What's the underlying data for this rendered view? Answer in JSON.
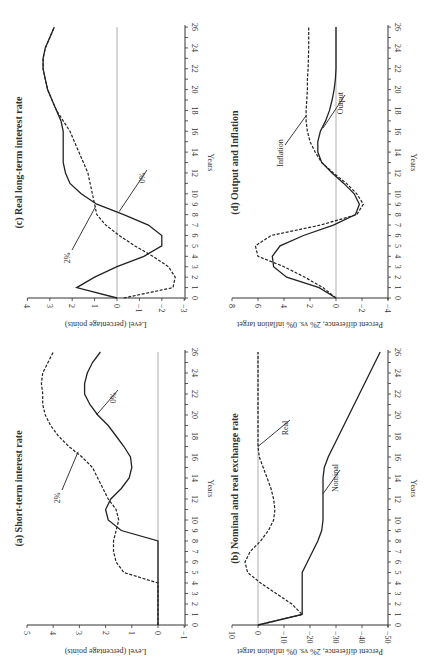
{
  "figure": {
    "orientation": "rotated 90 degrees counterclockwise",
    "panels": {
      "a": {
        "title": "(a) Short-term interest rate",
        "ylabel": "Level (percentage points)",
        "xlabel": "Years"
      },
      "b": {
        "title": "(b) Nominal and real exchange rate",
        "ylabel": "Percent difference, 2% vs. 0% inflation target",
        "xlabel": "Years"
      },
      "c": {
        "title": "(c) Real long-term interest rate",
        "ylabel": "Level (percentage points)",
        "xlabel": "Years"
      },
      "d": {
        "title": "(d) Output and Inflation",
        "ylabel": "Percent difference, 2% vs. 0% inflation target",
        "xlabel": "Years"
      }
    }
  },
  "chart_data": [
    {
      "id": "a",
      "type": "line",
      "title": "(a) Short-term interest rate",
      "xlabel": "Years",
      "ylabel": "Level (percentage points)",
      "xlim": [
        0,
        26
      ],
      "ylim": [
        -1,
        5
      ],
      "xticks": [
        0,
        1,
        2,
        3,
        4,
        5,
        6,
        7,
        8,
        9,
        10,
        12,
        14,
        16,
        18,
        20,
        22,
        24,
        26
      ],
      "yticks": [
        -1,
        0,
        1,
        2,
        3,
        4,
        5
      ],
      "zero_line": true,
      "x": [
        0,
        2,
        4,
        5,
        6,
        7,
        8,
        9,
        10,
        11,
        12,
        13,
        14,
        15,
        16,
        17,
        18,
        19,
        20,
        21,
        22,
        23,
        24,
        25,
        26
      ],
      "series": [
        {
          "name": "0%",
          "style": "solid",
          "values": [
            0,
            0,
            0,
            0,
            0,
            0,
            0,
            1.4,
            1.9,
            2.0,
            1.8,
            1.4,
            1.1,
            1.0,
            1.05,
            1.3,
            1.6,
            1.9,
            2.3,
            2.6,
            2.8,
            2.8,
            2.7,
            2.5,
            2.2
          ]
        },
        {
          "name": "2%",
          "style": "dashed",
          "values": [
            0,
            0,
            0,
            1.3,
            1.6,
            1.7,
            1.7,
            1.6,
            1.5,
            1.6,
            1.9,
            2.1,
            2.3,
            2.5,
            2.9,
            3.4,
            3.8,
            4.1,
            4.3,
            4.4,
            4.4,
            4.45,
            4.4,
            4.2,
            4.0
          ]
        }
      ]
    },
    {
      "id": "b",
      "type": "line",
      "title": "(b) Nominal and real exchange rate",
      "xlabel": "Years",
      "ylabel": "Percent difference, 2% vs. 0% inflation target",
      "xlim": [
        0,
        26
      ],
      "ylim": [
        -50,
        10
      ],
      "xticks": [
        0,
        1,
        2,
        3,
        4,
        5,
        6,
        7,
        8,
        9,
        10,
        12,
        14,
        16,
        18,
        20,
        22,
        24,
        26
      ],
      "yticks": [
        10,
        0,
        -10,
        -20,
        -30,
        -40,
        -50
      ],
      "zero_line": true,
      "x": [
        0,
        1,
        2,
        3,
        4,
        5,
        6,
        7,
        8,
        9,
        10,
        11,
        12,
        13,
        14,
        15,
        16,
        17,
        18,
        20,
        22,
        24,
        26
      ],
      "series": [
        {
          "name": "Nominal",
          "style": "solid",
          "values": [
            0,
            -17,
            -17,
            -17,
            -17,
            -17,
            -19,
            -21,
            -23,
            -24.5,
            -25,
            -25,
            -25,
            -25,
            -25,
            -25.5,
            -27,
            -29,
            -31,
            -35,
            -39,
            -43,
            -47
          ]
        },
        {
          "name": "Real",
          "style": "dashed",
          "values": [
            0,
            -17,
            -13,
            -7,
            -1,
            4,
            5,
            3,
            -1,
            -4,
            -6,
            -6.5,
            -6,
            -5,
            -3.5,
            -2,
            -0.5,
            0,
            0,
            0,
            0,
            0,
            0
          ]
        }
      ]
    },
    {
      "id": "c",
      "type": "line",
      "title": "(c) Real long-term interest rate",
      "xlabel": "Years",
      "ylabel": "Level (percentage points)",
      "xlim": [
        0,
        26
      ],
      "ylim": [
        -3,
        4
      ],
      "xticks": [
        0,
        1,
        2,
        3,
        4,
        5,
        6,
        7,
        8,
        9,
        10,
        12,
        14,
        16,
        18,
        20,
        22,
        24,
        26
      ],
      "yticks": [
        4,
        3,
        2,
        1,
        0,
        -1,
        -2,
        -3
      ],
      "zero_line": true,
      "x": [
        0,
        1,
        2,
        3,
        4,
        5,
        6,
        7,
        8,
        9,
        10,
        11,
        12,
        13,
        14,
        15,
        16,
        17,
        18,
        19,
        20,
        21,
        22,
        23,
        24,
        25,
        26
      ],
      "series": [
        {
          "name": "0%",
          "style": "solid",
          "values": [
            0,
            1.8,
            1.0,
            0.0,
            -1.2,
            -2.0,
            -2.0,
            -1.4,
            -0.3,
            0.9,
            1.6,
            2.1,
            2.3,
            2.4,
            2.4,
            2.4,
            2.4,
            2.5,
            2.7,
            2.9,
            3.1,
            3.2,
            3.3,
            3.3,
            3.2,
            3.0,
            2.8
          ]
        },
        {
          "name": "2%",
          "style": "dashed",
          "values": [
            -0.3,
            -2.5,
            -2.6,
            -2.3,
            -1.6,
            -0.8,
            -0.1,
            0.5,
            0.9,
            1.0,
            1.1,
            1.2,
            1.3,
            1.5,
            1.7,
            1.9,
            2.1,
            2.4,
            2.7,
            2.9,
            3.1,
            3.2,
            3.3,
            3.3,
            3.2,
            3.0,
            2.8
          ]
        }
      ]
    },
    {
      "id": "d",
      "type": "line",
      "title": "(d) Output and Inflation",
      "xlabel": "Years",
      "ylabel": "Percent difference, 2% vs. 0% inflation target",
      "xlim": [
        0,
        26
      ],
      "ylim": [
        -4,
        8
      ],
      "xticks": [
        0,
        1,
        2,
        3,
        4,
        5,
        6,
        7,
        8,
        9,
        10,
        12,
        14,
        16,
        18,
        20,
        22,
        24,
        26
      ],
      "yticks": [
        8,
        6,
        4,
        2,
        0,
        -2,
        -4
      ],
      "zero_line": true,
      "x": [
        0,
        1,
        2,
        3,
        4,
        5,
        6,
        7,
        8,
        9,
        10,
        11,
        12,
        13,
        14,
        15,
        16,
        17,
        18,
        19,
        20,
        21,
        22,
        24,
        26
      ],
      "series": [
        {
          "name": "Output",
          "style": "solid",
          "values": [
            0,
            1.3,
            3.8,
            4.8,
            4.9,
            4.3,
            2.5,
            0.2,
            -1.5,
            -1.8,
            -1.4,
            -0.6,
            0.3,
            1.1,
            1.4,
            1.4,
            1.2,
            0.8,
            0.5,
            0.3,
            0.15,
            0.05,
            0,
            0,
            0
          ]
        },
        {
          "name": "Inflation",
          "style": "dashed",
          "values": [
            0,
            1.0,
            2.4,
            4.0,
            6.0,
            6.2,
            5.0,
            1.2,
            -1.6,
            -2.1,
            -1.6,
            -0.8,
            0.2,
            1.1,
            1.6,
            2.0,
            2.2,
            2.3,
            2.3,
            2.25,
            2.2,
            2.2,
            2.15,
            2.1,
            2.1
          ]
        }
      ]
    }
  ]
}
